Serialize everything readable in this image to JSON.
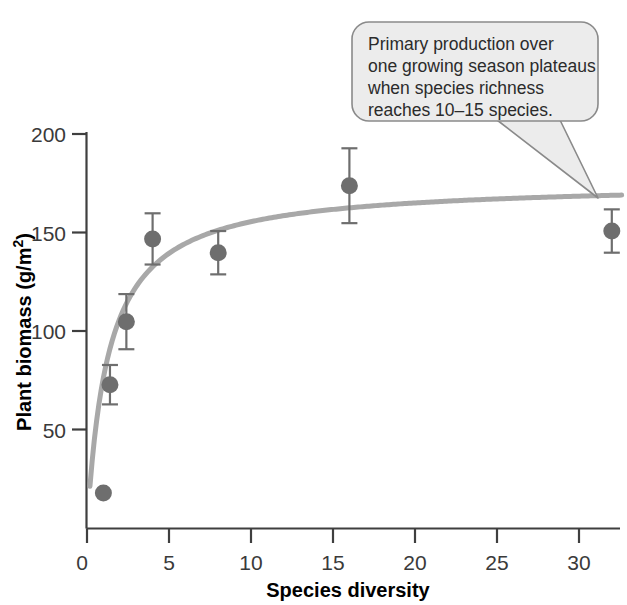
{
  "chart_data": {
    "type": "scatter",
    "title": "",
    "xlabel": "Species diversity",
    "ylabel": "Plant biomass (g/m2)",
    "ylabel_main": "Plant biomass (g/m",
    "ylabel_sup": "2",
    "ylabel_tail": ")",
    "xlim": [
      0,
      33
    ],
    "ylim": [
      0,
      205
    ],
    "grid": false,
    "legend": null,
    "x_ticks": [
      "0",
      "5",
      "10",
      "15",
      "20",
      "25",
      "30"
    ],
    "x_tick_values": [
      0,
      5,
      10,
      15,
      20,
      25,
      30
    ],
    "y_ticks": [
      "50",
      "100",
      "150",
      "200"
    ],
    "y_tick_values": [
      50,
      100,
      150,
      200
    ],
    "y_origin_label": "0",
    "points": [
      {
        "x": 1.0,
        "y": 18,
        "err": 0
      },
      {
        "x": 1.4,
        "y": 73,
        "err": 10
      },
      {
        "x": 2.4,
        "y": 105,
        "err": 14
      },
      {
        "x": 4.0,
        "y": 147,
        "err": 13
      },
      {
        "x": 8.0,
        "y": 140,
        "err": 11
      },
      {
        "x": 16.0,
        "y": 174,
        "err": 19
      },
      {
        "x": 32.0,
        "y": 151,
        "err": 11
      }
    ],
    "fit_curve": {
      "description": "saturating curve",
      "vmax": 176,
      "km": 1.3,
      "x_start": 0.18,
      "x_end": 32.6
    },
    "marker_color": "#6e6e6e",
    "curve_color": "#a8a8a8",
    "axis_color": "#3f3f3f"
  },
  "callout": {
    "lines": [
      "Primary production over",
      "one growing season plateaus",
      "when species richness",
      "reaches 10–15 species."
    ],
    "fill_color": "#ececec",
    "border_color": "#8a8a8a",
    "target_point_index": 6
  }
}
